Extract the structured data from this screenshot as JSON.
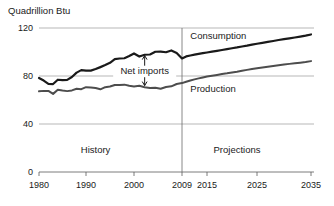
{
  "chart_data": {
    "type": "line",
    "title": "",
    "ylabel": "Quadrillion Btu",
    "xlabel": "",
    "ylim": [
      0,
      120
    ],
    "xlim": [
      1980,
      2035
    ],
    "yticks": [
      0,
      40,
      80,
      120
    ],
    "xticks": [
      1980,
      1990,
      2000,
      2009,
      2015,
      2025,
      2035
    ],
    "ytick_labels": [
      "0",
      "40",
      "80",
      "120"
    ],
    "xtick_labels": [
      "1980",
      "1990",
      "2000",
      "2009",
      "2015",
      "2025",
      "2035"
    ],
    "grid": "horizontal",
    "legend": "inline-labels",
    "divider_year": 2009,
    "period_labels": [
      {
        "text": "History",
        "x": 1992,
        "y": 18
      },
      {
        "text": "Projections",
        "x": 2021,
        "y": 18
      }
    ],
    "annotations": [
      {
        "text": "Net imports",
        "type": "double-arrow",
        "x": 2002,
        "y_top": 97,
        "y_bottom": 72,
        "label_y": 84
      }
    ],
    "series": [
      {
        "name": "Consumption",
        "color": "#1a1a1a",
        "width": 2.2,
        "label_x": 2011,
        "label_y": 113,
        "x": [
          1980,
          1981,
          1982,
          1983,
          1984,
          1985,
          1986,
          1987,
          1988,
          1989,
          1990,
          1991,
          1992,
          1993,
          1994,
          1995,
          1996,
          1997,
          1998,
          1999,
          2000,
          2001,
          2002,
          2003,
          2004,
          2005,
          2006,
          2007,
          2008,
          2009,
          2010,
          2011,
          2012,
          2013,
          2014,
          2015,
          2016,
          2017,
          2018,
          2019,
          2020,
          2021,
          2022,
          2023,
          2024,
          2025,
          2026,
          2027,
          2028,
          2029,
          2030,
          2031,
          2032,
          2033,
          2034,
          2035
        ],
        "values": [
          78.4,
          76.2,
          73.5,
          73.3,
          76.9,
          76.5,
          76.8,
          79.2,
          82.8,
          84.9,
          84.5,
          84.5,
          85.8,
          87.4,
          89.1,
          91.0,
          94.0,
          94.6,
          94.8,
          96.6,
          98.8,
          96.2,
          97.7,
          97.9,
          100.2,
          100.3,
          99.8,
          101.3,
          99.2,
          94.6,
          96.3,
          97.1,
          97.8,
          98.4,
          99.0,
          99.6,
          100.3,
          101.0,
          101.7,
          102.4,
          103.1,
          103.8,
          104.6,
          105.3,
          106.1,
          106.9,
          107.6,
          108.4,
          109.2,
          110.0,
          110.7,
          111.4,
          112.1,
          112.8,
          113.6,
          114.6
        ]
      },
      {
        "name": "Production",
        "color": "#4d4d4d",
        "width": 2.0,
        "label_x": 2011,
        "label_y": 69,
        "x": [
          1980,
          1981,
          1982,
          1983,
          1984,
          1985,
          1986,
          1987,
          1988,
          1989,
          1990,
          1991,
          1992,
          1993,
          1994,
          1995,
          1996,
          1997,
          1998,
          1999,
          2000,
          2001,
          2002,
          2003,
          2004,
          2005,
          2006,
          2007,
          2008,
          2009,
          2010,
          2011,
          2012,
          2013,
          2014,
          2015,
          2016,
          2017,
          2018,
          2019,
          2020,
          2021,
          2022,
          2023,
          2024,
          2025,
          2026,
          2027,
          2028,
          2029,
          2030,
          2031,
          2032,
          2033,
          2034,
          2035
        ],
        "values": [
          67.2,
          67.6,
          67.6,
          65.1,
          68.5,
          67.9,
          67.4,
          68.0,
          69.4,
          69.0,
          70.7,
          70.5,
          70.0,
          68.9,
          70.7,
          71.2,
          72.5,
          72.5,
          72.8,
          71.8,
          71.3,
          71.8,
          70.7,
          70.0,
          70.2,
          69.4,
          70.8,
          71.4,
          73.3,
          74.1,
          75.2,
          76.3,
          77.2,
          78.0,
          78.8,
          79.5,
          80.2,
          80.9,
          81.6,
          82.2,
          82.9,
          83.6,
          84.4,
          85.1,
          85.8,
          86.5,
          87.1,
          87.8,
          88.4,
          89.0,
          89.6,
          90.1,
          90.6,
          91.1,
          91.6,
          92.4
        ]
      }
    ]
  }
}
